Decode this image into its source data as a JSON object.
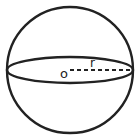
{
  "diagram": {
    "type": "sphere",
    "labels": {
      "center": "o",
      "radius": "r"
    },
    "colors": {
      "stroke": "#222222",
      "background": "#ffffff"
    }
  }
}
